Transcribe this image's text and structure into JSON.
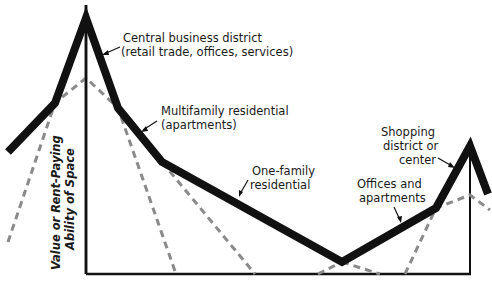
{
  "diagram": {
    "type": "bid-rent land value profile",
    "y_axis_label": [
      "Value or Rent-Paying",
      "Ability of Space"
    ],
    "labels": {
      "cbd": [
        "Central business district",
        "(retail trade, offices, services)"
      ],
      "multifamily": [
        "Multifamily residential",
        "(apartments)"
      ],
      "one_family": [
        "One-family",
        "residential"
      ],
      "offices": [
        "Offices and",
        "apartments"
      ],
      "shopping": [
        "Shopping",
        "district or",
        "center"
      ]
    },
    "colors": {
      "solid_line": "#111111",
      "dashed_line": "#8a8a8a",
      "axis": "#111111"
    },
    "solid_profile": "8,152 55,103 86,18 118,108 162,162 342,262 436,208 470,146 488,194",
    "dashed_curves": {
      "cbd": "8,242 55,103 86,78 118,108 176,274",
      "multifamily": "162,162 255,274",
      "one_family_tail": "342,262 380,274",
      "offices_left": "318,274 342,262",
      "shopping": "405,274 436,208 470,195 490,210"
    }
  }
}
